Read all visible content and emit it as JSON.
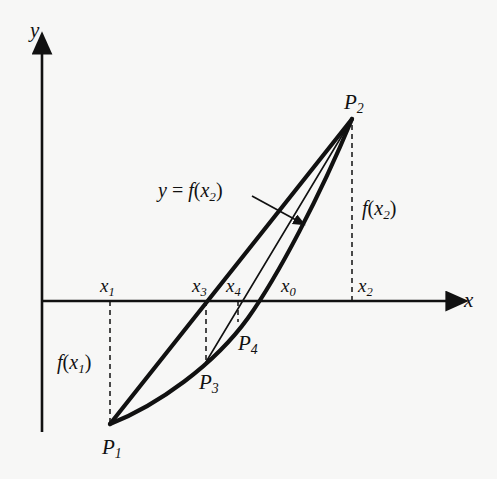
{
  "figure": {
    "background_color": "#f7f7f6",
    "ink_color": "#111111"
  },
  "axes": {
    "x_label": "x",
    "y_label": "y",
    "x_axis_y_px": 301,
    "y_axis_x_px": 42,
    "x_axis_start_px": 42,
    "x_axis_end_px": 455,
    "y_axis_top_px": 45,
    "y_axis_bottom_px": 432
  },
  "ticks": [
    {
      "id": "x1",
      "base": "x",
      "sub": "1",
      "label_x": 100,
      "label_y": 276,
      "line_x": 110,
      "line_from_y": 301,
      "line_to_y": 424
    },
    {
      "id": "x3",
      "base": "x",
      "sub": "3",
      "label_x": 192,
      "label_y": 276,
      "line_x": 206,
      "line_from_y": 301,
      "line_to_y": 362
    },
    {
      "id": "x4",
      "base": "x",
      "sub": "4",
      "label_x": 226,
      "label_y": 276,
      "line_x": 238,
      "line_from_y": 301,
      "line_to_y": 322
    },
    {
      "id": "x0",
      "base": "x",
      "sub": "0",
      "label_x": 281,
      "label_y": 276,
      "line_x": null,
      "line_from_y": null,
      "line_to_y": null
    },
    {
      "id": "x2",
      "base": "x",
      "sub": "2",
      "label_x": 358,
      "label_y": 276,
      "line_x": 352,
      "line_from_y": 301,
      "line_to_y": 120
    }
  ],
  "points": [
    {
      "id": "P1",
      "base": "P",
      "sub": "1",
      "x": 110,
      "y": 424,
      "label_x": 102,
      "label_y": 437
    },
    {
      "id": "P2",
      "base": "P",
      "sub": "2",
      "x": 352,
      "y": 119,
      "label_x": 344,
      "label_y": 92
    },
    {
      "id": "P3",
      "base": "P",
      "sub": "3",
      "x": 206,
      "y": 362,
      "label_x": 199,
      "label_y": 372
    },
    {
      "id": "P4",
      "base": "P",
      "sub": "4",
      "x": 238,
      "y": 322,
      "label_x": 238,
      "label_y": 333
    }
  ],
  "value_labels": [
    {
      "id": "fx1",
      "prefix": "f",
      "open": "(",
      "base": "x",
      "sub": "1",
      "close": ")",
      "x": 57,
      "y": 352
    },
    {
      "id": "fx2",
      "prefix": "f",
      "open": "(",
      "base": "x",
      "sub": "2",
      "close": ")",
      "x": 362,
      "y": 198
    }
  ],
  "annotation": {
    "id": "curve-equation",
    "text_y": "y",
    "text_eq": "=",
    "text_f": "f",
    "text_open": "(",
    "text_base": "x",
    "text_sub": "2",
    "text_close": ")",
    "label_x": 158,
    "label_y": 180,
    "leader_from_x": 252,
    "leader_from_y": 196,
    "leader_to_x": 300,
    "leader_to_y": 222
  },
  "curves": [
    {
      "id": "chord-p1-p2",
      "description": "thick straight chord from P1 to P2",
      "stroke_width": 4.2,
      "path": "M 110 424 L 352 119"
    },
    {
      "id": "function-curve",
      "description": "thick convex curve y = f(x) from P1 through P3 and x0 up to P2",
      "stroke_width": 4.2,
      "path": "M 110 424 C 158 405, 214 365, 248 318 C 278 276, 320 196, 352 119"
    },
    {
      "id": "secant-p3-p2",
      "description": "thin secant line from P3 up to P2 crossing axis at x4",
      "stroke_width": 1.6,
      "path": "M 206 362 L 352 119"
    }
  ],
  "dashed_style": {
    "dash_array": "5,4",
    "stroke_width": 1.5
  }
}
